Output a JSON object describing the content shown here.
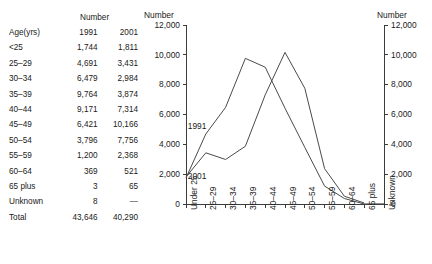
{
  "table": {
    "span_header": "Number",
    "columns": [
      "Age(yrs)",
      "1991",
      "2001"
    ],
    "rows": [
      {
        "age": "<25",
        "y1991": "1,744",
        "y2001": "1,811"
      },
      {
        "age": "25–29",
        "y1991": "4,691",
        "y2001": "3,431"
      },
      {
        "age": "30–34",
        "y1991": "6,479",
        "y2001": "2,984"
      },
      {
        "age": "35–39",
        "y1991": "9,764",
        "y2001": "3,874"
      },
      {
        "age": "40–44",
        "y1991": "9,171",
        "y2001": "7,314"
      },
      {
        "age": "45–49",
        "y1991": "6,421",
        "y2001": "10,166"
      },
      {
        "age": "50–54",
        "y1991": "3,796",
        "y2001": "7,756"
      },
      {
        "age": "55–59",
        "y1991": "1,200",
        "y2001": "2,368"
      },
      {
        "age": "60–64",
        "y1991": "369",
        "y2001": "521"
      },
      {
        "age": "65 plus",
        "y1991": "3",
        "y2001": "65"
      },
      {
        "age": "Unknown",
        "y1991": "8",
        "y2001": "—"
      },
      {
        "age": "Total",
        "y1991": "43,646",
        "y2001": "40,290"
      }
    ]
  },
  "chart_data": {
    "type": "line",
    "title": "",
    "xlabel": "",
    "ylabel": "Number",
    "ylabel_right": "Number",
    "ylim": [
      0,
      12000
    ],
    "ytick_labels": [
      "12,000",
      "10,000",
      "8,000",
      "6,000",
      "4,000",
      "2,000",
      "0"
    ],
    "ytick_values": [
      12000,
      10000,
      8000,
      6000,
      4000,
      2000,
      0
    ],
    "ytick_labels_right": [
      "12,000",
      "10,000",
      "8,000",
      "6,000",
      "4,000",
      "2,000",
      "0"
    ],
    "grid": false,
    "legend_position": "inline-annotation",
    "categories": [
      "Under 25",
      "25–29",
      "30–34",
      "35–39",
      "40–44",
      "45–49",
      "50–54",
      "55–59",
      "60–64",
      "65 plus",
      "Unknown"
    ],
    "series": [
      {
        "name": "1991",
        "values": [
          1744,
          4691,
          6479,
          9764,
          9171,
          6421,
          3796,
          1200,
          369,
          3,
          8
        ]
      },
      {
        "name": "2001",
        "values": [
          1811,
          3431,
          2984,
          3874,
          7314,
          10166,
          7756,
          2368,
          521,
          65,
          null
        ]
      }
    ],
    "annotations": [
      {
        "text": "1991",
        "x": "25–29",
        "y": 5200
      },
      {
        "text": "2001",
        "x": "25–29",
        "y": 1850
      }
    ]
  }
}
